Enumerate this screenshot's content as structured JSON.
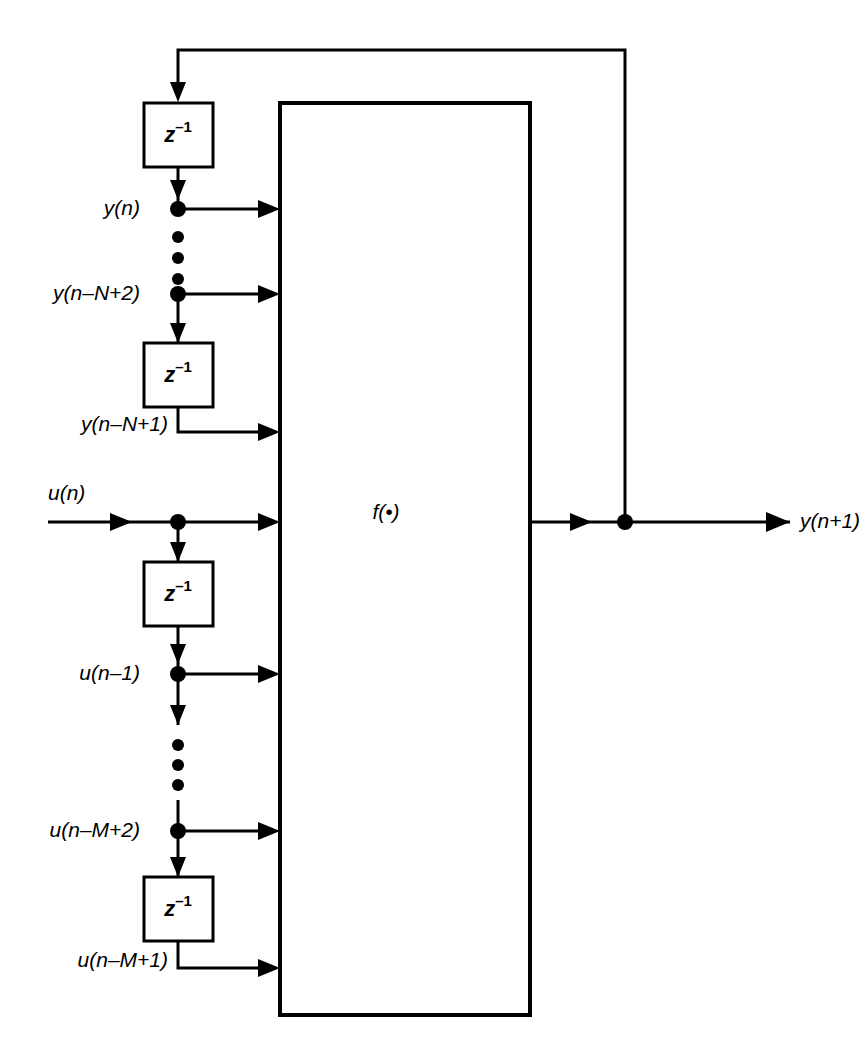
{
  "diagram": {
    "type": "signal-flow-block-diagram",
    "colors": {
      "line": "#000000",
      "background": "#ffffff",
      "block_fill": "#ffffff"
    },
    "processing_block": {
      "label": "f(•)",
      "name": "nonlinear-mapping-block"
    },
    "delay_blocks": [
      {
        "id": "delay-y-1",
        "label_base": "z",
        "label_exp": "–1"
      },
      {
        "id": "delay-y-2",
        "label_base": "z",
        "label_exp": "–1"
      },
      {
        "id": "delay-u-1",
        "label_base": "z",
        "label_exp": "–1"
      },
      {
        "id": "delay-u-2",
        "label_base": "z",
        "label_exp": "–1"
      }
    ],
    "signals": {
      "feedback_taps": [
        {
          "id": "tap-y-n",
          "label": "y(n)"
        },
        {
          "id": "tap-y-nN2",
          "label": "y(n–N+2)"
        },
        {
          "id": "tap-y-nN1",
          "label": "y(n–N+1)"
        }
      ],
      "input_taps": [
        {
          "id": "tap-u-n",
          "label": "u(n)"
        },
        {
          "id": "tap-u-n1",
          "label": "u(n–1)"
        },
        {
          "id": "tap-u-nM2",
          "label": "u(n–M+2)"
        },
        {
          "id": "tap-u-nM1",
          "label": "u(n–M+1)"
        }
      ],
      "output": {
        "id": "output-signal",
        "label": "y(n+1)"
      }
    },
    "ellipsis": {
      "upper": "vertical-ellipsis-feedback",
      "lower": "vertical-ellipsis-input"
    }
  }
}
